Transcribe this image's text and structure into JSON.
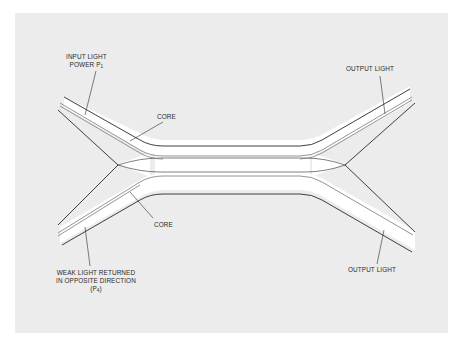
{
  "diagram": {
    "type": "optical fiber directional coupler (X-coupler)",
    "colors": {
      "background": "#ffffff",
      "panel": "#ececec",
      "fiber_fill": "#ffffff",
      "cladding_line": "#2a2a2a",
      "core_line": "#7a7a7a",
      "text": "#2a2a2a"
    },
    "labels": {
      "input_line1": "INPUT LIGHT",
      "input_line2": "POWER P",
      "input_sub": "1",
      "core_top": "CORE",
      "core_bottom": "CORE",
      "output_top": "OUTPUT LIGHT",
      "output_bottom": "OUTPUT LIGHT",
      "weak_line1": "WEAK LIGHT RETURNED",
      "weak_line2": "IN OPPOSITE DIRECTION",
      "weak_line3_prefix": "(P",
      "weak_sub": "4",
      "weak_line3_suffix": ")"
    },
    "ports": [
      {
        "name": "top-left",
        "role": "input",
        "power": "P1"
      },
      {
        "name": "bottom-left",
        "role": "returned light",
        "power": "P4"
      },
      {
        "name": "top-right",
        "role": "output"
      },
      {
        "name": "bottom-right",
        "role": "output"
      }
    ]
  }
}
